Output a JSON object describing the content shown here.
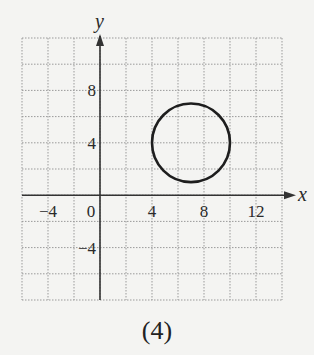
{
  "chart_data": {
    "type": "scatter",
    "title": "",
    "caption": "(4)",
    "xlabel": "x",
    "ylabel": "y",
    "xlim": [
      -6,
      14
    ],
    "ylim": [
      -8,
      12
    ],
    "grid": true,
    "grid_step": 2,
    "x_ticks": [
      -4,
      0,
      4,
      8,
      12
    ],
    "y_ticks": [
      -4,
      4,
      8
    ],
    "x_tick_labels": [
      "−4",
      "0",
      "4",
      "8",
      "12"
    ],
    "y_tick_labels": [
      "−4",
      "4",
      "8"
    ],
    "shapes": [
      {
        "kind": "circle",
        "center": [
          7,
          4
        ],
        "radius": 3
      }
    ]
  },
  "colors": {
    "grid": "#9a9a9a",
    "axis": "#333333",
    "curve": "#1e1e1e",
    "background": "#f4f4f2"
  }
}
